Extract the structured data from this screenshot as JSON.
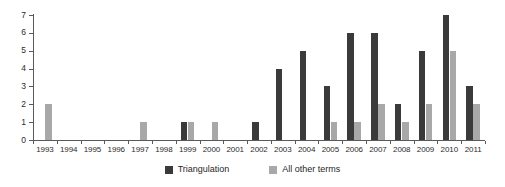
{
  "chart_data": {
    "type": "bar",
    "title": "",
    "subtitle": "",
    "xlabel": "",
    "ylabel": "",
    "ylim": [
      0,
      7
    ],
    "yticks": [
      0,
      1,
      2,
      3,
      4,
      5,
      6,
      7
    ],
    "grid": false,
    "legend_position": "bottom",
    "categories": [
      "1993",
      "1994",
      "1995",
      "1996",
      "1997",
      "1998",
      "1999",
      "2000",
      "2001",
      "2002",
      "2003",
      "2004",
      "2005",
      "2006",
      "2007",
      "2008",
      "2009",
      "2010",
      "2011"
    ],
    "series": [
      {
        "name": "Triangulation",
        "color": "#3a3a3a",
        "values": [
          0,
          0,
          0,
          0,
          0,
          0,
          1,
          0,
          0,
          1,
          4,
          5,
          3,
          6,
          6,
          2,
          5,
          7,
          3
        ]
      },
      {
        "name": "All other terms",
        "color": "#a8a8a8",
        "values": [
          2,
          0,
          0,
          0,
          1,
          0,
          1,
          1,
          0,
          0,
          0,
          0,
          1,
          1,
          2,
          1,
          2,
          5,
          2
        ]
      }
    ],
    "annotations": []
  },
  "axis": {
    "y_tick_labels": [
      "0",
      "1",
      "2",
      "3",
      "4",
      "5",
      "6",
      "7"
    ]
  },
  "legend": {
    "items": [
      {
        "label": "Triangulation"
      },
      {
        "label": "All other terms"
      }
    ]
  }
}
